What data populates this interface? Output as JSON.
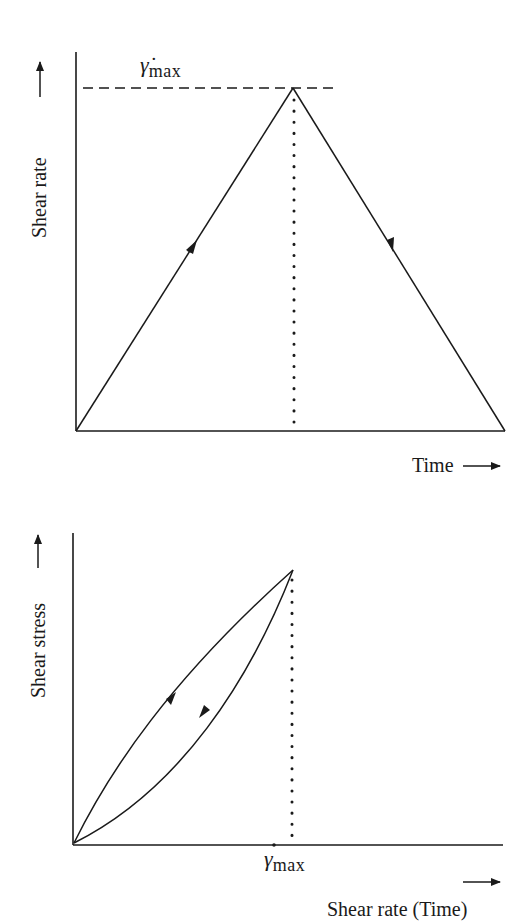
{
  "top_chart": {
    "y_label": "Shear rate",
    "x_label": "Time",
    "peak_label_symbol": "γ̇",
    "peak_label_subscript": "max",
    "description": "Shear rate ramps linearly up to maximum then linearly back down over time"
  },
  "bottom_chart": {
    "y_label": "Shear stress",
    "x_label": "Shear rate (Time)",
    "peak_label_symbol": "γ",
    "peak_label_subscript": "max",
    "description": "Hysteresis loop: up-curve above, down-curve below, meeting at max shear rate"
  },
  "colors": {
    "ink": "#1a1a1a",
    "background": "#ffffff"
  }
}
